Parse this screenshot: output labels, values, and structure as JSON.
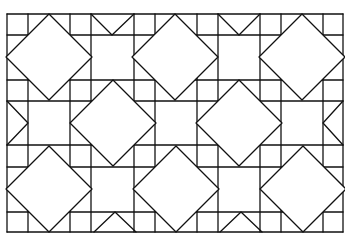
{
  "figure": {
    "stroke_color": "#111111",
    "background_color": "#ffffff",
    "grid": {
      "vertical_lines_x": [
        7,
        28,
        70,
        91,
        134,
        155,
        197,
        218,
        260,
        281,
        323,
        343
      ],
      "horizontal_lines_y": [
        14,
        35,
        80,
        101,
        145,
        167,
        212,
        232
      ]
    },
    "large_diamonds": [
      {
        "cx": 49,
        "cy": 57,
        "r": 43
      },
      {
        "cx": 175,
        "cy": 57,
        "r": 43
      },
      {
        "cx": 302,
        "cy": 57,
        "r": 43
      },
      {
        "cx": 113,
        "cy": 123,
        "r": 43
      },
      {
        "cx": 239,
        "cy": 123,
        "r": 43
      },
      {
        "cx": 49,
        "cy": 189,
        "r": 43
      },
      {
        "cx": 176,
        "cy": 189,
        "r": 43
      },
      {
        "cx": 303,
        "cy": 189,
        "r": 43
      }
    ],
    "edge_triangles": [
      {
        "points": "91,14 112,35 134,14"
      },
      {
        "points": "218,14 239,35 260,14"
      },
      {
        "points": "94,232 115,212 136,232"
      },
      {
        "points": "220,232 241,212 262,232"
      },
      {
        "points": "7,101 28,123 7,145"
      },
      {
        "points": "343,101 323,123 343,145"
      }
    ]
  }
}
